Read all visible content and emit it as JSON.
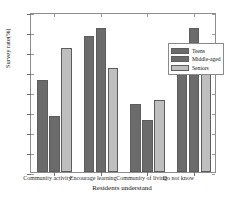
{
  "chart_data": {
    "type": "bar",
    "title": "",
    "xlabel": "Residents understand",
    "ylabel": "Survey rate(%)",
    "categories": [
      "Community activity",
      "Encourage learning",
      "Community of living",
      "Do not know"
    ],
    "series": [
      {
        "name": "Teens",
        "color": "#6b6b6b",
        "values": [
          23,
          34,
          17,
          26
        ]
      },
      {
        "name": "Middle-aged",
        "color": "#6b6b6b",
        "values": [
          14,
          36,
          13,
          36
        ]
      },
      {
        "name": "Seniors",
        "color": "#bfbfbf",
        "values": [
          31,
          26,
          18,
          25
        ]
      }
    ],
    "ylim": [
      0,
      40
    ],
    "yticks": [
      0,
      5,
      10,
      15,
      20,
      25,
      30,
      35,
      40
    ],
    "ytick_labels": [
      "0",
      "5",
      "10",
      "15",
      "20",
      "25",
      "30",
      "35",
      "40"
    ],
    "grid": false,
    "legend_position": "upper-center-right",
    "bar_edge_color": "#5d5d5d",
    "axis_color": "#8d8d8d"
  }
}
